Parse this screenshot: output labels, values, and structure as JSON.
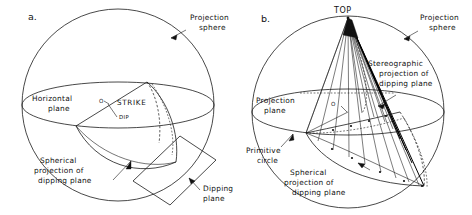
{
  "figure": {
    "background_color": "#ffffff",
    "line_color": "#1a1a1a",
    "width": 472,
    "height": 215
  },
  "panel_a": {
    "id": "a.",
    "labels": {
      "projection_sphere_line1": "Projection",
      "projection_sphere_line2": "sphere",
      "horizontal_plane_line1": "Horizontal",
      "horizontal_plane_line2": "plane",
      "origin": "O",
      "strike": "STRIKE",
      "dip": "DIP",
      "spherical_projection_line1": "Spherical",
      "spherical_projection_line2": "projection of",
      "spherical_projection_line3": "dipping plane",
      "dipping_plane_line1": "Dipping",
      "dipping_plane_line2": "plane"
    }
  },
  "panel_b": {
    "id": "b.",
    "labels": {
      "top": "TOP",
      "projection_sphere_line1": "Projection",
      "projection_sphere_line2": "sphere",
      "projection_plane_line1": "Projection",
      "projection_plane_line2": "plane",
      "origin": "O",
      "stereographic_line1": "Stereographic",
      "stereographic_line2": "projection of",
      "stereographic_line3": "dipping plane",
      "primitive_circle_line1": "Primitive",
      "primitive_circle_line2": "circle",
      "spherical_projection_line1": "Spherical",
      "spherical_projection_line2": "projection of",
      "spherical_projection_line3": "dipping plane"
    }
  }
}
